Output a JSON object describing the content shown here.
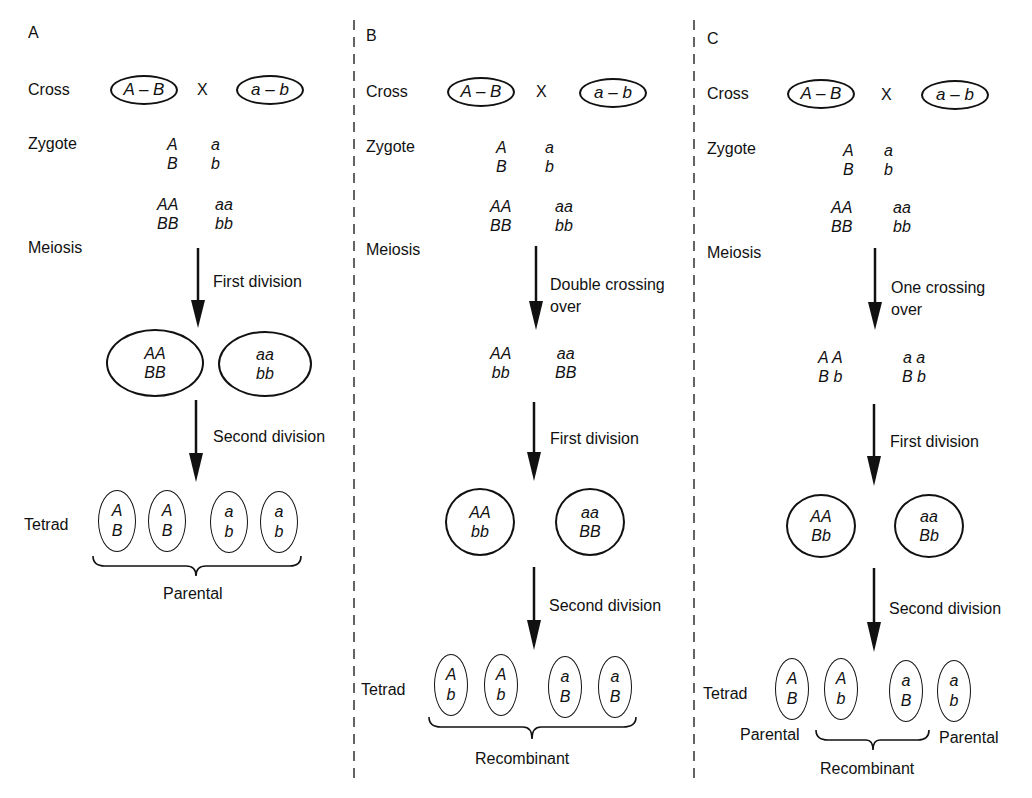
{
  "panels": {
    "a": {
      "letter": "A",
      "cross_label": "Cross",
      "parent1": "A – B",
      "cross_symbol": "X",
      "parent2": "a – b",
      "zygote_label": "Zygote",
      "zygote": {
        "top_left": "A",
        "bottom_left": "B",
        "top_right": "a",
        "bottom_right": "b"
      },
      "replicated": {
        "top_left": "AA",
        "bottom_left": "BB",
        "top_right": "aa",
        "bottom_right": "bb"
      },
      "meiosis_label": "Meiosis",
      "arrow1_label": "First division",
      "cells": [
        {
          "top": "AA",
          "bottom": "BB"
        },
        {
          "top": "aa",
          "bottom": "bb"
        }
      ],
      "arrow2_label": "Second division",
      "tetrad_label": "Tetrad",
      "spores": [
        {
          "top": "A",
          "bottom": "B"
        },
        {
          "top": "A",
          "bottom": "B"
        },
        {
          "top": "a",
          "bottom": "b"
        },
        {
          "top": "a",
          "bottom": "b"
        }
      ],
      "brace_label": "Parental"
    },
    "b": {
      "letter": "B",
      "cross_label": "Cross",
      "parent1": "A – B",
      "cross_symbol": "X",
      "parent2": "a – b",
      "zygote_label": "Zygote",
      "zygote": {
        "top_left": "A",
        "bottom_left": "B",
        "top_right": "a",
        "bottom_right": "b"
      },
      "replicated": {
        "top_left": "AA",
        "bottom_left": "BB",
        "top_right": "aa",
        "bottom_right": "bb"
      },
      "meiosis_label": "Meiosis",
      "crossover_label_line1": "Double crossing",
      "crossover_label_line2": "over",
      "after_crossover": {
        "top_left": "AA",
        "bottom_left": "bb",
        "top_right": "aa",
        "bottom_right": "BB"
      },
      "arrow1_label": "First division",
      "cells": [
        {
          "top": "AA",
          "bottom": "bb"
        },
        {
          "top": "aa",
          "bottom": "BB"
        }
      ],
      "arrow2_label": "Second division",
      "tetrad_label": "Tetrad",
      "spores": [
        {
          "top": "A",
          "bottom": "b"
        },
        {
          "top": "A",
          "bottom": "b"
        },
        {
          "top": "a",
          "bottom": "B"
        },
        {
          "top": "a",
          "bottom": "B"
        }
      ],
      "brace_label": "Recombinant"
    },
    "c": {
      "letter": "C",
      "cross_label": "Cross",
      "parent1": "A – B",
      "cross_symbol": "X",
      "parent2": "a – b",
      "zygote_label": "Zygote",
      "zygote": {
        "top_left": "A",
        "bottom_left": "B",
        "top_right": "a",
        "bottom_right": "b"
      },
      "replicated": {
        "top_left": "AA",
        "bottom_left": "BB",
        "top_right": "aa",
        "bottom_right": "bb"
      },
      "meiosis_label": "Meiosis",
      "crossover_label_line1": "One crossing",
      "crossover_label_line2": "over",
      "after_crossover": {
        "top_left": "A A",
        "bottom_left": "B b",
        "top_right": "a a",
        "bottom_right": "B b"
      },
      "arrow1_label": "First division",
      "cells": [
        {
          "top": "AA",
          "bottom": "Bb"
        },
        {
          "top": "aa",
          "bottom": "Bb"
        }
      ],
      "arrow2_label": "Second division",
      "tetrad_label": "Tetrad",
      "spores": [
        {
          "top": "A",
          "bottom": "B"
        },
        {
          "top": "A",
          "bottom": "b"
        },
        {
          "top": "a",
          "bottom": "B"
        },
        {
          "top": "a",
          "bottom": "b"
        }
      ],
      "parental_left_label": "Parental",
      "parental_right_label": "Parental",
      "brace_label": "Recombinant"
    }
  }
}
